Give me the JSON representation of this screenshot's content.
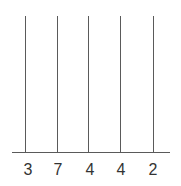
{
  "diagram": {
    "type": "place-value-abacus",
    "rods": [
      {
        "label": "3",
        "beads": 0
      },
      {
        "label": "7",
        "beads": 0
      },
      {
        "label": "4",
        "beads": 0
      },
      {
        "label": "4",
        "beads": 0
      },
      {
        "label": "2",
        "beads": 0
      }
    ],
    "colors": {
      "line": "#5a5a5a",
      "text": "#333333"
    }
  }
}
